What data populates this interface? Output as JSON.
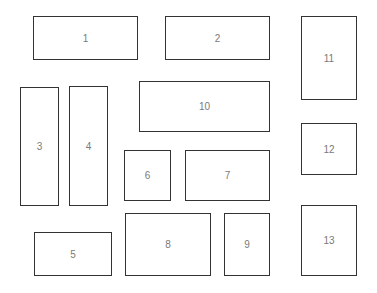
{
  "boxes": [
    {
      "label": "1",
      "x": 33,
      "y": 16,
      "w": 105,
      "h": 44
    },
    {
      "label": "2",
      "x": 165,
      "y": 16,
      "w": 105,
      "h": 44
    },
    {
      "label": "3",
      "x": 20,
      "y": 87,
      "w": 39,
      "h": 119
    },
    {
      "label": "4",
      "x": 69,
      "y": 86,
      "w": 39,
      "h": 120
    },
    {
      "label": "5",
      "x": 34,
      "y": 232,
      "w": 78,
      "h": 44
    },
    {
      "label": "6",
      "x": 124,
      "y": 150,
      "w": 47,
      "h": 51
    },
    {
      "label": "7",
      "x": 185,
      "y": 150,
      "w": 85,
      "h": 51
    },
    {
      "label": "8",
      "x": 125,
      "y": 213,
      "w": 86,
      "h": 63
    },
    {
      "label": "9",
      "x": 224,
      "y": 213,
      "w": 46,
      "h": 63
    },
    {
      "label": "10",
      "x": 139,
      "y": 81,
      "w": 131,
      "h": 51
    },
    {
      "label": "11",
      "x": 301,
      "y": 16,
      "w": 56,
      "h": 84
    },
    {
      "label": "12",
      "x": 301,
      "y": 123,
      "w": 56,
      "h": 52
    },
    {
      "label": "13",
      "x": 301,
      "y": 205,
      "w": 56,
      "h": 71
    }
  ]
}
